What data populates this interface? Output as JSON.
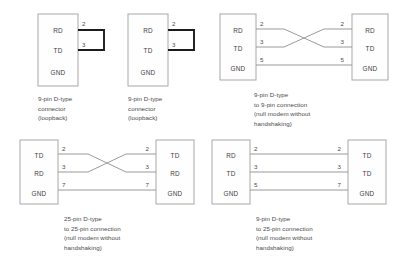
{
  "diagrams": [
    {
      "id": "loopback-9pin-left",
      "kind": "loopback",
      "caption": "9-pin D-type\nconnector\n(loopback)",
      "connector": {
        "signals": [
          "RD",
          "TD",
          "GND"
        ],
        "pins": [
          "2",
          "3",
          ""
        ]
      }
    },
    {
      "id": "loopback-9pin-right",
      "kind": "loopback",
      "caption": "9-pin D-type\nconnector\n(loopback)",
      "connector": {
        "signals": [
          "RD",
          "TD",
          "GND"
        ],
        "pins": [
          "2",
          "3",
          ""
        ]
      }
    },
    {
      "id": "null-modem-9-to-9",
      "kind": "crossover",
      "caption": "9-pin D-type\nto 9-pin connection\n(null modem without\nhandshaking)",
      "left": {
        "signals": [
          "RD",
          "TD",
          "GND"
        ],
        "pins": [
          "2",
          "3",
          "5"
        ]
      },
      "right": {
        "signals": [
          "RD",
          "TD",
          "GND"
        ],
        "pins": [
          "2",
          "3",
          "5"
        ]
      }
    },
    {
      "id": "null-modem-25-to-25",
      "kind": "crossover",
      "caption": "25-pin D-type\nto 25-pin connection\n(null modem without\nhandshaking)",
      "left": {
        "signals": [
          "TD",
          "RD",
          "GND"
        ],
        "pins": [
          "2",
          "3",
          "7"
        ]
      },
      "right": {
        "signals": [
          "TD",
          "RD",
          "GND"
        ],
        "pins": [
          "2",
          "3",
          "7"
        ]
      }
    },
    {
      "id": "null-modem-9-to-25",
      "kind": "straight",
      "caption": "9-pin D-type\nto 25-pin connection\n(null modem without\nhandshaking)",
      "left": {
        "signals": [
          "RD",
          "TD",
          "GND"
        ],
        "pins": [
          "2",
          "3",
          "5"
        ]
      },
      "right": {
        "signals": [
          "TD",
          "TD",
          "GND"
        ],
        "pins": [
          "2",
          "3",
          "7"
        ]
      }
    }
  ],
  "colors": {
    "wire": "#8e8e8e",
    "connector_border": "#a8a8a8",
    "loopback_bracket": "#1c1c1c",
    "text": "#3d3d3d",
    "background": "#ffffff"
  }
}
